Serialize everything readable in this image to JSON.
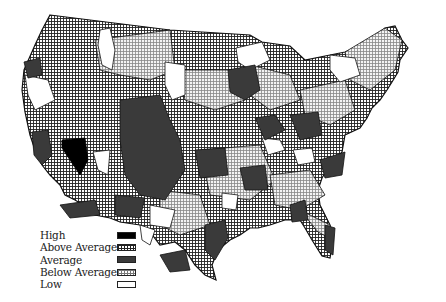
{
  "map": {
    "subject": "Contiguous United States by region",
    "legend": {
      "items": [
        {
          "label": "High",
          "key": "high",
          "fill": "#000000"
        },
        {
          "label": "Above Average",
          "key": "above",
          "fill": "dense-grid"
        },
        {
          "label": "Average",
          "key": "average",
          "fill": "#3a3a3a"
        },
        {
          "label": "Below Average",
          "key": "below",
          "fill": "light-grid"
        },
        {
          "label": "Low",
          "key": "low",
          "fill": "#ffffff"
        }
      ]
    },
    "colors": {
      "high": "#000000",
      "average": "#3a3a3a",
      "outline": "#1a1a1a",
      "background": "#ffffff"
    }
  }
}
